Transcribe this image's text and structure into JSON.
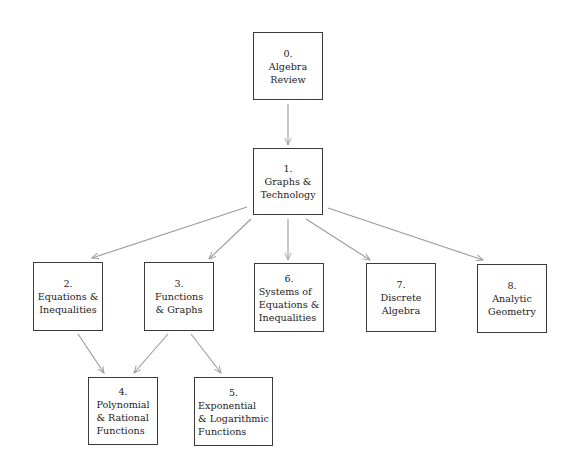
{
  "diagram": {
    "title": "",
    "edge_color": "#9a9a9a",
    "border_color": "#3a3a3a",
    "nodes": [
      {
        "id": "n0",
        "number": "0.",
        "lines": [
          "Algebra",
          "Review"
        ],
        "box": [
          253,
          32,
          70,
          68
        ]
      },
      {
        "id": "n1",
        "number": "1.",
        "lines": [
          "Graphs &",
          "Technology"
        ],
        "box": [
          253,
          148,
          70,
          67
        ]
      },
      {
        "id": "n2",
        "number": "2.",
        "lines": [
          "Equations &",
          "Inequalities"
        ],
        "box": [
          33,
          262,
          70,
          69
        ]
      },
      {
        "id": "n3",
        "number": "3.",
        "lines": [
          "Functions",
          "& Graphs"
        ],
        "box": [
          144,
          262,
          70,
          69
        ]
      },
      {
        "id": "n6",
        "number": "6.",
        "lines": [
          "Systems of",
          "Equations &",
          "Inequalities"
        ],
        "box": [
          254,
          263,
          70,
          69
        ]
      },
      {
        "id": "n7",
        "number": "7.",
        "lines": [
          "Discrete",
          "Algebra"
        ],
        "box": [
          366,
          263,
          70,
          69
        ]
      },
      {
        "id": "n8",
        "number": "8.",
        "lines": [
          "Analytic",
          "Geometry"
        ],
        "box": [
          477,
          264,
          70,
          69
        ]
      },
      {
        "id": "n4",
        "number": "4.",
        "lines": [
          "Polynomial",
          "& Rational",
          "Functions"
        ],
        "box": [
          88,
          377,
          70,
          68
        ]
      },
      {
        "id": "n5",
        "number": "5.",
        "lines": [
          "Exponential",
          "& Logarithmic",
          "Functions"
        ],
        "box": [
          194,
          377,
          79,
          69
        ]
      }
    ],
    "edges": [
      {
        "from": "n0",
        "to": "n1",
        "points": [
          288,
          104,
          288,
          145
        ]
      },
      {
        "from": "n1",
        "to": "n2",
        "points": [
          247,
          207,
          92,
          258
        ]
      },
      {
        "from": "n1",
        "to": "n3",
        "points": [
          251,
          219,
          209,
          259
        ]
      },
      {
        "from": "n1",
        "to": "n6",
        "points": [
          288,
          219,
          288,
          260
        ]
      },
      {
        "from": "n1",
        "to": "n7",
        "points": [
          306,
          219,
          370,
          260
        ]
      },
      {
        "from": "n1",
        "to": "n8",
        "points": [
          328,
          208,
          483,
          260
        ]
      },
      {
        "from": "n2",
        "to": "n4",
        "points": [
          78,
          334,
          104,
          373
        ]
      },
      {
        "from": "n3",
        "to": "n4",
        "points": [
          168,
          334,
          134,
          373
        ]
      },
      {
        "from": "n3",
        "to": "n5",
        "points": [
          191,
          334,
          221,
          373
        ]
      }
    ]
  }
}
